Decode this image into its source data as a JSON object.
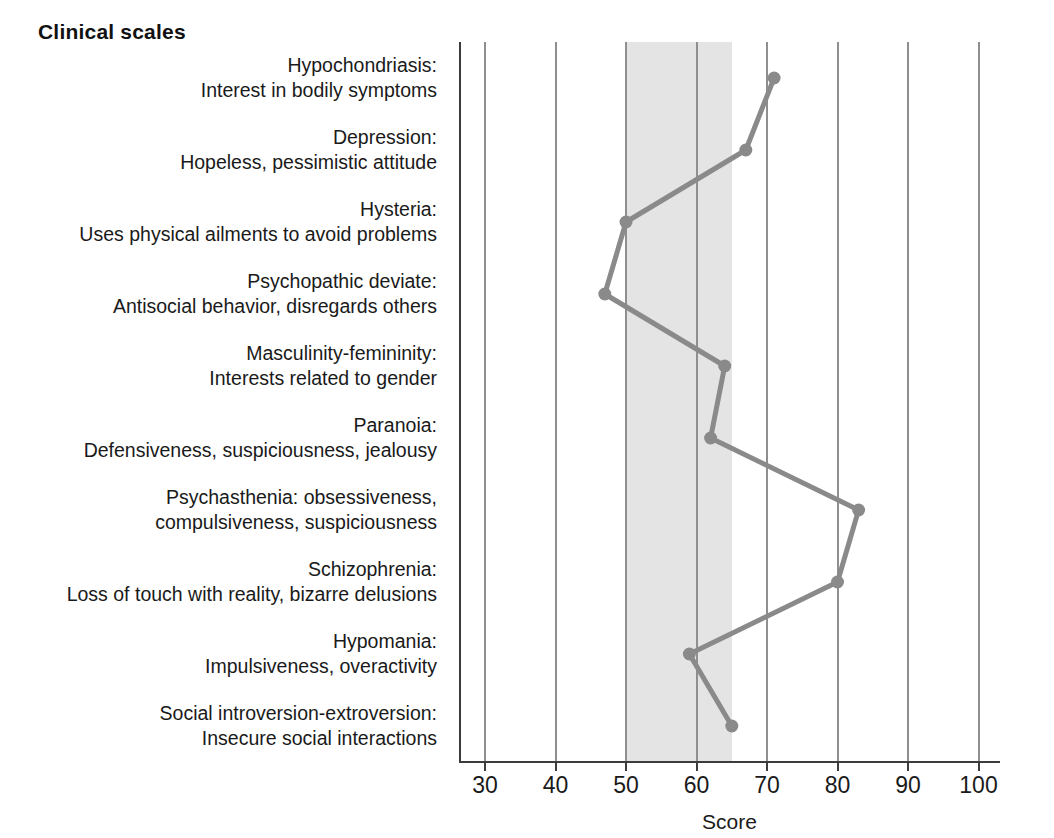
{
  "title": "Clinical scales",
  "axis": {
    "x_title": "Score",
    "ticks": [
      30,
      40,
      50,
      60,
      70,
      80,
      90,
      100
    ]
  },
  "colors": {
    "line": "#8a8a8a",
    "marker": "#8a8a8a",
    "normal_band": "#e4e4e4",
    "gridline": "#8f8f8f",
    "frame": "#3c3c3c",
    "text": "#1a1a1a",
    "background": "#ffffff"
  },
  "scales": [
    {
      "name": "Hypochondriasis",
      "line1": "Hypochondriasis:",
      "line2": "Interest in bodily symptoms",
      "score": 71
    },
    {
      "name": "Depression",
      "line1": "Depression:",
      "line2": "Hopeless, pessimistic attitude",
      "score": 67
    },
    {
      "name": "Hysteria",
      "line1": "Hysteria:",
      "line2": "Uses physical ailments to avoid problems",
      "score": 50
    },
    {
      "name": "Psychopathic deviate",
      "line1": "Psychopathic deviate:",
      "line2": "Antisocial behavior, disregards others",
      "score": 47
    },
    {
      "name": "Masculinity-femininity",
      "line1": "Masculinity-femininity:",
      "line2": "Interests related to gender",
      "score": 64
    },
    {
      "name": "Paranoia",
      "line1": "Paranoia:",
      "line2": "Defensiveness, suspiciousness, jealousy",
      "score": 62
    },
    {
      "name": "Psychasthenia",
      "line1": "Psychasthenia: obsessiveness,",
      "line2": "compulsiveness, suspiciousness",
      "score": 83
    },
    {
      "name": "Schizophrenia",
      "line1": "Schizophrenia:",
      "line2": "Loss of touch with reality, bizarre delusions",
      "score": 80
    },
    {
      "name": "Hypomania",
      "line1": "Hypomania:",
      "line2": "Impulsiveness, overactivity",
      "score": 59
    },
    {
      "name": "Social introversion-extroversion",
      "line1": "Social introversion-extroversion:",
      "line2": "Insecure social interactions",
      "score": 65
    }
  ],
  "chart_data": {
    "type": "line",
    "title": "Clinical scales",
    "xlabel": "Score",
    "ylabel": "",
    "orientation": "horizontal",
    "grid": true,
    "legend": null,
    "xlim": [
      26,
      103
    ],
    "xticks": [
      30,
      40,
      50,
      60,
      70,
      80,
      90,
      100
    ],
    "categories": [
      "Hypochondriasis: Interest in bodily symptoms",
      "Depression: Hopeless, pessimistic attitude",
      "Hysteria: Uses physical ailments to avoid problems",
      "Psychopathic deviate: Antisocial behavior, disregards others",
      "Masculinity-femininity: Interests related to gender",
      "Paranoia: Defensiveness, suspiciousness, jealousy",
      "Psychasthenia: obsessiveness, compulsiveness, suspiciousness",
      "Schizophrenia: Loss of touch with reality, bizarre delusions",
      "Hypomania: Impulsiveness, overactivity",
      "Social introversion-extroversion: Insecure social interactions"
    ],
    "values": [
      71,
      67,
      50,
      47,
      64,
      62,
      83,
      80,
      59,
      65
    ],
    "shaded_region": {
      "label": "normal range",
      "from": 50,
      "to": 65
    }
  }
}
